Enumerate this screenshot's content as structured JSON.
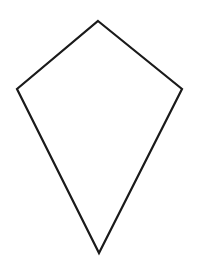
{
  "document": {
    "title": "Kite Shape Outline",
    "type": "line-drawing",
    "background_color": "#ffffff",
    "width": 197,
    "height": 263
  },
  "drawing": {
    "name": "kite",
    "description": "Kite (deltoid) quadrilateral outline drawing",
    "fill_color": "#ffffff",
    "stroke_color": "#1a1a1a",
    "stroke_width": 2.2,
    "closed": true,
    "vertices": [
      {
        "label": "top",
        "x": 98,
        "y": 21
      },
      {
        "label": "right",
        "x": 182,
        "y": 89
      },
      {
        "label": "bottom",
        "x": 99,
        "y": 253
      },
      {
        "label": "left",
        "x": 17,
        "y": 89
      }
    ],
    "points_attr": "98,21 182,89 99,253 17,89"
  }
}
